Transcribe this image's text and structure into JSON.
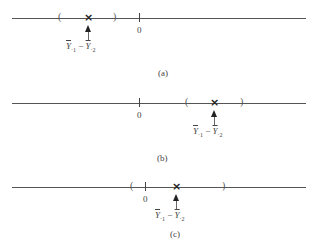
{
  "figure": {
    "panels": [
      {
        "caption": "(a)",
        "zero_label": "0",
        "left_paren": "(",
        "right_paren": ")",
        "estimate_marker": "×",
        "estimate_label": {
          "symbol": "Y",
          "sub1": "·1",
          "minus": "−",
          "sub2": "·2"
        },
        "layout": {
          "axis_y": 18,
          "left_paren_x": 60,
          "estimate_x": 88,
          "right_paren_x": 115,
          "zero_x": 139,
          "caption_y": 68
        }
      },
      {
        "caption": "(b)",
        "zero_label": "0",
        "left_paren": "(",
        "right_paren": ")",
        "estimate_marker": "×",
        "estimate_label": {
          "symbol": "Y",
          "sub1": "·1",
          "minus": "−",
          "sub2": "·2"
        },
        "layout": {
          "axis_y": 103,
          "left_paren_x": 187,
          "estimate_x": 214,
          "right_paren_x": 242,
          "zero_x": 139,
          "caption_y": 156
        }
      },
      {
        "caption": "(c)",
        "zero_label": "0",
        "left_paren": "(",
        "right_paren": ")",
        "estimate_marker": "×",
        "estimate_label": {
          "symbol": "Y",
          "sub1": "·1",
          "minus": "−",
          "sub2": "·2"
        },
        "layout": {
          "axis_y": 187,
          "left_paren_x": 132,
          "estimate_x": 176,
          "right_paren_x": 224,
          "zero_x": 145,
          "caption_y": 231
        }
      }
    ]
  }
}
